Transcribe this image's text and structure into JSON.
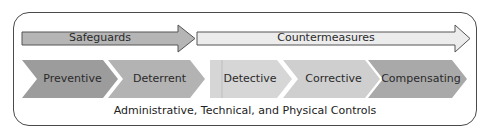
{
  "diagram": {
    "arrows": [
      {
        "label": "Safeguards",
        "fill": "#b5b5b5"
      },
      {
        "label": "Countermeasures",
        "fill": "#ececec"
      }
    ],
    "controls": [
      {
        "label": "Preventive",
        "fill": "#9c9c9c"
      },
      {
        "label": "Deterrent",
        "fill": "#b3b3b3"
      },
      {
        "label": "Detective",
        "fill": "#d6d6d6"
      },
      {
        "label": "Corrective",
        "fill": "#cfcfcf"
      },
      {
        "label": "Compensating",
        "fill": "#a9a9a9"
      }
    ],
    "footer": "Administrative, Technical, and Physical Controls"
  }
}
